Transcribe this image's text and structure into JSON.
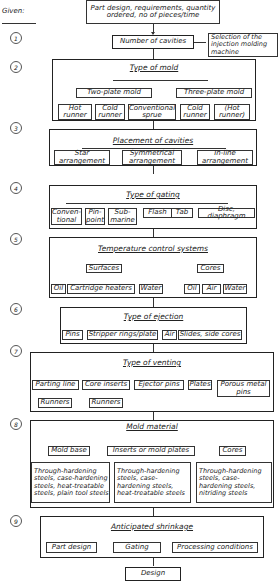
{
  "given_label": "Given:",
  "steps": [
    "1",
    "2",
    "3",
    "4",
    "5",
    "6",
    "7",
    "8",
    "9"
  ],
  "start": "Part design, requirements, quantity ordered, no of pieces/time",
  "step1": {
    "main": "Number of cavities",
    "side": "Selection of the injection molding machine"
  },
  "step2": {
    "title": "Type of mold",
    "two_plate": "Two-plate mold",
    "three_plate": "Three-plate mold",
    "items": [
      "Hot runner",
      "Cold runner",
      "Conventional sprue",
      "Cold runner",
      "(Hot runner)"
    ]
  },
  "step3": {
    "title": "Placement of cavities",
    "items": [
      "Star arrangement",
      "Symmetrical arrangement",
      "In-line arrangement"
    ]
  },
  "step4": {
    "title": "Type of gating",
    "items": [
      "Conven-tional",
      "Pin-point",
      "Sub-marine",
      "Flash",
      "Tab",
      "Disc, diaphragm"
    ]
  },
  "step5": {
    "title": "Temperature control systems",
    "surfaces": "Surfaces",
    "cores": "Cores",
    "surface_items": [
      "Oil",
      "Cartridge heaters",
      "Water"
    ],
    "core_items": [
      "Oil",
      "Air",
      "Water"
    ]
  },
  "step6": {
    "title": "Type of ejection",
    "items": [
      "Pins",
      "Stripper rings/plate",
      "Air",
      "Slides, side cores"
    ]
  },
  "step7": {
    "title": "Type of venting",
    "items": [
      "Parting line",
      "Core inserts",
      "Ejector pins",
      "Plates",
      "Porous metal pins"
    ],
    "sub": [
      "Runners",
      "Runners"
    ]
  },
  "step8": {
    "title": "Mold material",
    "cols": [
      "Mold base",
      "Inserts or mold plates",
      "Cores"
    ],
    "details": [
      "Through-hardening steels, case-hardening steels, heat-treatable steels, plain tool steels",
      "Through-hardening steels, case-hardening steels, heat-treatable steels",
      "Through-hardening steels, case-hardening steels, nitriding steels"
    ]
  },
  "step9": {
    "title": "Anticipated shrinkage",
    "items": [
      "Part design",
      "Gating",
      "Processing conditions"
    ]
  },
  "end": "Design"
}
